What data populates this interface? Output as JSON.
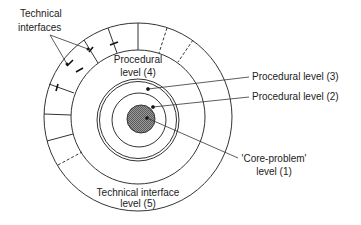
{
  "diagram": {
    "labels": {
      "technical_interfaces_line1": "Technical",
      "technical_interfaces_line2": "interfaces",
      "procedural_4_line1": "Procedural",
      "procedural_4_line2": "level (4)",
      "procedural_3": "Procedural level (3)",
      "procedural_2": "Procedural level (2)",
      "core_line1": "'Core-problem'",
      "core_line2": "level (1)",
      "technical_5_line1": "Technical interface",
      "technical_5_line2": "level (5)"
    },
    "colors": {
      "stroke": "#333333",
      "core_fill": "#8a8a8a",
      "text": "#222222"
    }
  }
}
